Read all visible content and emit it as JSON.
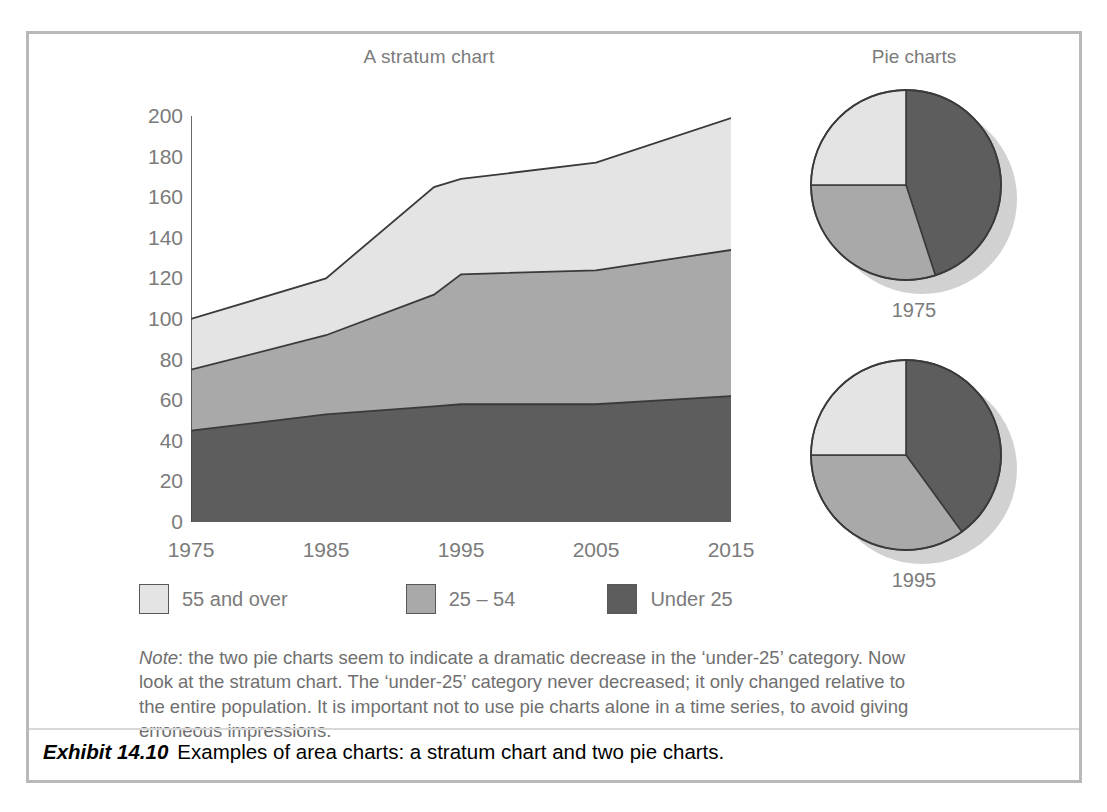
{
  "exhibit": {
    "label": "Exhibit 14.10",
    "caption": "Examples of area charts: a stratum chart and two pie charts."
  },
  "note": {
    "lead": "Note",
    "text": ": the two pie charts seem to indicate a dramatic decrease in the ‘under-25’ category. Now look at the stratum chart. The ‘under-25’ category never decreased; it only changed relative to the entire population. It is important not to use pie charts alone in a time series, to avoid giving erroneous impressions."
  },
  "legend": {
    "items": [
      {
        "label": "55 and over",
        "color": "#e4e4e4"
      },
      {
        "label": "25 – 54",
        "color": "#a9a9a9"
      },
      {
        "label": "Under 25",
        "color": "#5d5d5d"
      }
    ]
  },
  "colors": {
    "band_light": "#e4e4e4",
    "band_mid": "#a9a9a9",
    "band_dark": "#5d5d5d",
    "stroke": "#3a3a3a",
    "axis": "#444444",
    "text": "#7b7b7b",
    "frame": "#b9b9b9",
    "shadow": "#b4b4b4"
  },
  "chart_data": [
    {
      "type": "area",
      "title": "A stratum chart",
      "xlabel": "",
      "ylabel": "",
      "x": [
        1975,
        1985,
        1993,
        1995,
        2005,
        2015
      ],
      "categories": [
        "1975",
        "1985",
        "1995",
        "2005",
        "2015"
      ],
      "xlim": [
        1975,
        2015
      ],
      "ylim": [
        0,
        200
      ],
      "yticks": [
        0,
        20,
        40,
        60,
        80,
        100,
        120,
        140,
        160,
        180,
        200
      ],
      "xticks": [
        1975,
        1985,
        1995,
        2005,
        2015
      ],
      "grid": false,
      "stacked": true,
      "legend": "bottom",
      "series": [
        {
          "name": "Under 25",
          "color": "#5d5d5d",
          "values": [
            45,
            53,
            57,
            58,
            58,
            62
          ]
        },
        {
          "name": "25 – 54",
          "color": "#a9a9a9",
          "values": [
            30,
            39,
            55,
            64,
            66,
            72
          ]
        },
        {
          "name": "55 and over",
          "color": "#e4e4e4",
          "values": [
            25,
            28,
            53,
            47,
            53,
            65
          ]
        }
      ],
      "cumulative": {
        "under25": [
          45,
          53,
          57,
          58,
          58,
          62
        ],
        "to_54": [
          75,
          92,
          112,
          122,
          124,
          134
        ],
        "total": [
          100,
          120,
          165,
          169,
          177,
          199
        ]
      }
    },
    {
      "type": "pie",
      "title": "Pie charts",
      "caption": "1975",
      "labels": [
        "Under 25",
        "25 – 54",
        "55 and over"
      ],
      "values": [
        45,
        30,
        25
      ],
      "colors": [
        "#5d5d5d",
        "#a9a9a9",
        "#e4e4e4"
      ],
      "start_angle_deg": 0
    },
    {
      "type": "pie",
      "title": "",
      "caption": "1995",
      "labels": [
        "Under 25",
        "25 – 54",
        "55 and over"
      ],
      "values": [
        40,
        35,
        25
      ],
      "colors": [
        "#5d5d5d",
        "#a9a9a9",
        "#e4e4e4"
      ],
      "start_angle_deg": 0
    }
  ],
  "pies_title": "Pie charts"
}
